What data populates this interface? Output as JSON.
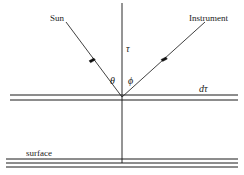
{
  "diagram": {
    "width": 244,
    "height": 175,
    "background_color": "#ffffff",
    "line_color": "#2b2b2b",
    "text_color": "#1a1a1a",
    "labels": {
      "sun": "Sun",
      "instrument": "Instrument",
      "tau": "τ",
      "theta": "θ",
      "phi": "ϕ",
      "d_tau": "dτ",
      "surface": "surface"
    },
    "elements": {
      "vertical_axis_name": "vertical optical depth axis",
      "sun_ray_name": "incoming solar ray",
      "instrument_ray_name": "outgoing instrument ray",
      "slab_name": "atmospheric layer d-tau slab",
      "surface_name": "surface boundary"
    }
  }
}
